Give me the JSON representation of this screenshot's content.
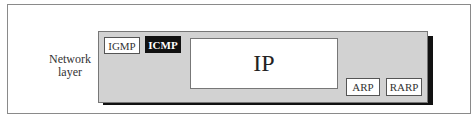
{
  "diagram": {
    "layer_label": [
      "Network",
      "layer"
    ],
    "protocols": {
      "igmp": "IGMP",
      "icmp": "ICMP",
      "ip": "IP",
      "arp": "ARP",
      "rarp": "RARP"
    },
    "colors": {
      "layer_fill": "#d2d2d2",
      "highlight_fill": "#111111",
      "highlight_text": "#ffffff",
      "box_fill": "#ffffff"
    },
    "highlighted": "ICMP"
  }
}
